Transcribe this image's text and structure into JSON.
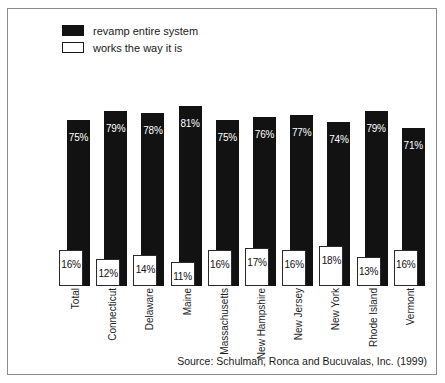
{
  "figure": {
    "source_note": "Source: Schulman, Ronca and Bucuvalas, Inc. (1999)"
  },
  "legend": {
    "items": [
      {
        "label": "revamp entire system",
        "swatch": "filled-black-square",
        "color": "#121212"
      },
      {
        "label": "works the way it is",
        "swatch": "hollow-white-square",
        "color": "#ffffff"
      }
    ]
  },
  "chart_data": {
    "type": "bar",
    "title": "",
    "subtitle": "",
    "xlabel": "",
    "ylabel": "",
    "ylim": [
      0,
      100
    ],
    "grid": false,
    "legend_position": "top-left",
    "categories": [
      "Total",
      "Connecticut",
      "Delaware",
      "Maine",
      "Massachusetts",
      "New Hampshire",
      "New Jersey",
      "New York",
      "Rhode Island",
      "Vermont"
    ],
    "series": [
      {
        "name": "revamp entire system",
        "color": "#121212",
        "values": [
          75,
          79,
          78,
          81,
          75,
          76,
          77,
          74,
          79,
          71
        ],
        "labels": [
          "75%",
          "79%",
          "78%",
          "81%",
          "75%",
          "76%",
          "77%",
          "74%",
          "79%",
          "71%"
        ]
      },
      {
        "name": "works the way it is",
        "color": "#ffffff",
        "values": [
          16,
          12,
          14,
          11,
          16,
          17,
          16,
          18,
          13,
          16
        ],
        "labels": [
          "16%",
          "12%",
          "14%",
          "11%",
          "16%",
          "17%",
          "16%",
          "18%",
          "13%",
          "16%"
        ]
      }
    ]
  }
}
